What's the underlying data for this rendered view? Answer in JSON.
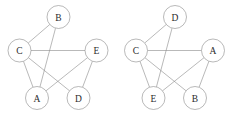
{
  "figure": {
    "background_color": "#ffffff",
    "stroke_color": "#8a8a8a",
    "label_color": "#2b2b2b",
    "node_radius": 11.5,
    "width": 233,
    "height": 121
  },
  "graphs": [
    {
      "id": "left-graph",
      "name": "graph-left",
      "nodes": [
        {
          "id": "top",
          "label": "B",
          "cx": 58.5,
          "cy": 17.0
        },
        {
          "id": "left",
          "label": "C",
          "cx": 19.5,
          "cy": 50.5
        },
        {
          "id": "right",
          "label": "E",
          "cx": 96.5,
          "cy": 50.5
        },
        {
          "id": "bottom-left",
          "label": "A",
          "cx": 37.0,
          "cy": 98.0
        },
        {
          "id": "bottom-right",
          "label": "D",
          "cx": 78.5,
          "cy": 98.0
        }
      ],
      "edges": [
        {
          "from": "top",
          "to": "left",
          "label": "B-C"
        },
        {
          "from": "top",
          "to": "bottom-left",
          "label": "B-A"
        },
        {
          "from": "left",
          "to": "right",
          "label": "C-E"
        },
        {
          "from": "left",
          "to": "bottom-left",
          "label": "C-A"
        },
        {
          "from": "left",
          "to": "bottom-right",
          "label": "C-D"
        },
        {
          "from": "right",
          "to": "bottom-left",
          "label": "E-A"
        },
        {
          "from": "right",
          "to": "bottom-right",
          "label": "E-D"
        }
      ]
    },
    {
      "id": "right-graph",
      "name": "graph-right",
      "nodes": [
        {
          "id": "top",
          "label": "D",
          "cx": 175.0,
          "cy": 17.0
        },
        {
          "id": "left",
          "label": "C",
          "cx": 136.0,
          "cy": 50.5
        },
        {
          "id": "right",
          "label": "A",
          "cx": 213.0,
          "cy": 50.5
        },
        {
          "id": "bottom-left",
          "label": "E",
          "cx": 153.5,
          "cy": 98.0
        },
        {
          "id": "bottom-right",
          "label": "B",
          "cx": 195.0,
          "cy": 98.0
        }
      ],
      "edges": [
        {
          "from": "top",
          "to": "left",
          "label": "D-C"
        },
        {
          "from": "top",
          "to": "bottom-left",
          "label": "D-E"
        },
        {
          "from": "left",
          "to": "right",
          "label": "C-A"
        },
        {
          "from": "left",
          "to": "bottom-left",
          "label": "C-E"
        },
        {
          "from": "left",
          "to": "bottom-right",
          "label": "C-B"
        },
        {
          "from": "right",
          "to": "bottom-left",
          "label": "A-E"
        },
        {
          "from": "right",
          "to": "bottom-right",
          "label": "A-B"
        }
      ]
    }
  ]
}
